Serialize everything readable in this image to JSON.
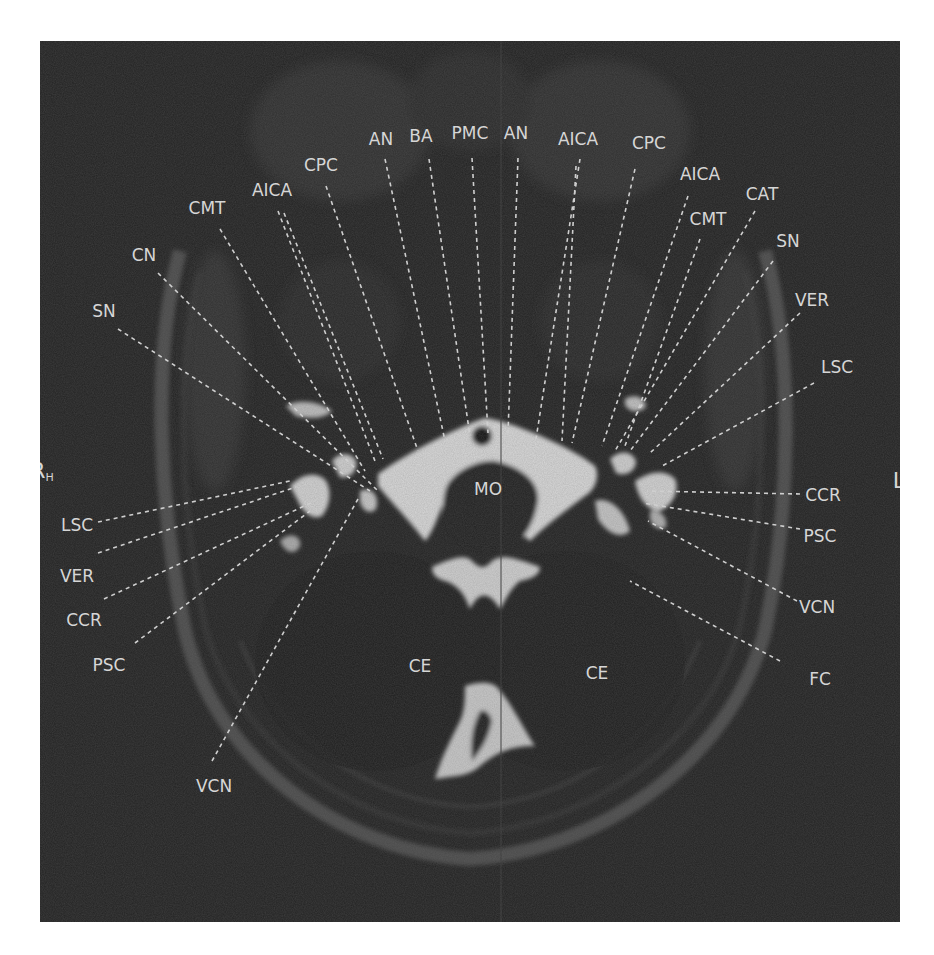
{
  "figure": {
    "colors": {
      "background": "#232323",
      "label": "#d6d6d6",
      "bright_csf": "#d8d8d8",
      "page": "#ffffff"
    },
    "orientation": {
      "right": {
        "main": "R",
        "sub": "H"
      },
      "left": {
        "main": "L",
        "sub": "F"
      }
    },
    "center_labels": [
      {
        "id": "mo",
        "text": "MO",
        "x": 448,
        "y": 448
      },
      {
        "id": "ce-right",
        "text": "CE",
        "x": 380,
        "y": 625
      },
      {
        "id": "ce-left",
        "text": "CE",
        "x": 557,
        "y": 632
      }
    ],
    "labels": [
      {
        "id": "an-1",
        "text": "AN",
        "x": 341,
        "y": 98,
        "lx1": 345,
        "ly1": 118,
        "lx2": 405,
        "ly2": 400
      },
      {
        "id": "ba",
        "text": "BA",
        "x": 381,
        "y": 95,
        "lx1": 389,
        "ly1": 118,
        "lx2": 430,
        "ly2": 395
      },
      {
        "id": "pmc",
        "text": "PMC",
        "x": 430,
        "y": 92,
        "lx1": 432,
        "ly1": 117,
        "lx2": 448,
        "ly2": 392
      },
      {
        "id": "an-2",
        "text": "AN",
        "x": 476,
        "y": 92,
        "lx1": 478,
        "ly1": 117,
        "lx2": 468,
        "ly2": 392
      },
      {
        "id": "aica-1",
        "text": "AICA",
        "x": 538,
        "y": 98,
        "lx1": 540,
        "ly1": 118,
        "lx2": 496,
        "ly2": 398
      },
      {
        "id": "aica-1b",
        "text": "",
        "x": 0,
        "y": 0,
        "lx1": 536,
        "ly1": 125,
        "lx2": 522,
        "ly2": 400
      },
      {
        "id": "cpc-1",
        "text": "CPC",
        "x": 609,
        "y": 102,
        "lx1": 595,
        "ly1": 128,
        "lx2": 532,
        "ly2": 402
      },
      {
        "id": "aica-2",
        "text": "AICA",
        "x": 660,
        "y": 133,
        "lx1": 648,
        "ly1": 155,
        "lx2": 562,
        "ly2": 405
      },
      {
        "id": "cat",
        "text": "CAT",
        "x": 722,
        "y": 153,
        "lx1": 715,
        "ly1": 170,
        "lx2": 575,
        "ly2": 410
      },
      {
        "id": "cmt-1",
        "text": "CMT",
        "x": 668,
        "y": 178,
        "lx1": 660,
        "ly1": 198,
        "lx2": 585,
        "ly2": 405
      },
      {
        "id": "sn-1",
        "text": "SN",
        "x": 748,
        "y": 200,
        "lx1": 733,
        "ly1": 220,
        "lx2": 590,
        "ly2": 410
      },
      {
        "id": "ver-1",
        "text": "VER",
        "x": 772,
        "y": 259,
        "lx1": 760,
        "ly1": 272,
        "lx2": 610,
        "ly2": 412
      },
      {
        "id": "lsc-1",
        "text": "LSC",
        "x": 797,
        "y": 326,
        "lx1": 774,
        "ly1": 342,
        "lx2": 622,
        "ly2": 425
      },
      {
        "id": "ccr-1",
        "text": "CCR",
        "x": 783,
        "y": 454,
        "lx1": 760,
        "ly1": 453,
        "lx2": 607,
        "ly2": 450
      },
      {
        "id": "psc-1",
        "text": "PSC",
        "x": 780,
        "y": 495,
        "lx1": 760,
        "ly1": 488,
        "lx2": 603,
        "ly2": 462
      },
      {
        "id": "vcn-1",
        "text": "VCN",
        "x": 777,
        "y": 566,
        "lx1": 757,
        "ly1": 560,
        "lx2": 608,
        "ly2": 480
      },
      {
        "id": "fc",
        "text": "FC",
        "x": 780,
        "y": 638,
        "lx1": 740,
        "ly1": 620,
        "lx2": 590,
        "ly2": 540
      },
      {
        "id": "cpc-2",
        "text": "CPC",
        "x": 281,
        "y": 124,
        "lx1": 286,
        "ly1": 145,
        "lx2": 378,
        "ly2": 410
      },
      {
        "id": "aica-3",
        "text": "AICA",
        "x": 232,
        "y": 149,
        "lx1": 238,
        "ly1": 170,
        "lx2": 335,
        "ly2": 420
      },
      {
        "id": "aica-3b",
        "text": "",
        "x": 0,
        "y": 0,
        "lx1": 244,
        "ly1": 172,
        "lx2": 343,
        "ly2": 418
      },
      {
        "id": "cmt-2",
        "text": "CMT",
        "x": 167,
        "y": 167,
        "lx1": 180,
        "ly1": 188,
        "lx2": 325,
        "ly2": 430
      },
      {
        "id": "cn",
        "text": "CN",
        "x": 104,
        "y": 214,
        "lx1": 118,
        "ly1": 232,
        "lx2": 338,
        "ly2": 450
      },
      {
        "id": "sn-2",
        "text": "SN",
        "x": 64,
        "y": 270,
        "lx1": 78,
        "ly1": 288,
        "lx2": 330,
        "ly2": 450
      },
      {
        "id": "lsc-2",
        "text": "LSC",
        "x": 37,
        "y": 484,
        "lx1": 58,
        "ly1": 481,
        "lx2": 250,
        "ly2": 440
      },
      {
        "id": "ver-2",
        "text": "VER",
        "x": 37,
        "y": 535,
        "lx1": 58,
        "ly1": 512,
        "lx2": 256,
        "ly2": 446
      },
      {
        "id": "ccr-2",
        "text": "CCR",
        "x": 44,
        "y": 579,
        "lx1": 64,
        "ly1": 558,
        "lx2": 275,
        "ly2": 460
      },
      {
        "id": "psc-2",
        "text": "PSC",
        "x": 69,
        "y": 624,
        "lx1": 95,
        "ly1": 602,
        "lx2": 270,
        "ly2": 470
      },
      {
        "id": "vcn-2",
        "text": "VCN",
        "x": 174,
        "y": 745,
        "lx1": 172,
        "ly1": 720,
        "lx2": 318,
        "ly2": 458
      }
    ]
  }
}
